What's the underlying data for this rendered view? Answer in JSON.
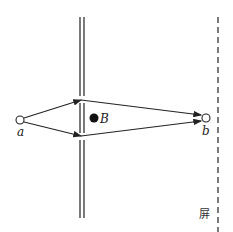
{
  "diagram": {
    "type": "double-slit electron interference with magnetic field",
    "labels": {
      "source": "a",
      "detector": "b",
      "field": "B",
      "screen": "屏"
    },
    "colors": {
      "line": "#222222",
      "background": "#ffffff"
    }
  }
}
